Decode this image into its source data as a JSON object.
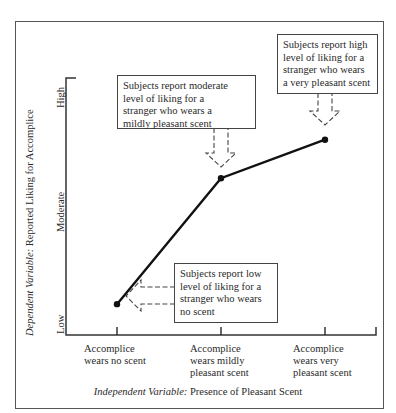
{
  "chart_data": {
    "type": "line",
    "title": "",
    "xlabel": "Independent Variable: Presence of Pleasant Scent",
    "xlabel_italic_prefix": "Independent Variable:",
    "xlabel_rest": " Presence of Pleasant Scent",
    "ylabel": "Dependent Variable: Reported Liking for Accomplice",
    "ylabel_italic_prefix": "Dependent Variable:",
    "ylabel_rest": " Reported Liking for Accomplice",
    "categories": [
      [
        "Accomplice",
        "wears no scent"
      ],
      [
        "Accomplice",
        "wears mildly",
        "pleasant scent"
      ],
      [
        "Accomplice",
        "wears very",
        "pleasant scent"
      ]
    ],
    "y_ticks": [
      "Low",
      "Moderate",
      "High"
    ],
    "ylim": [
      0,
      10
    ],
    "series": [
      {
        "name": "Reported liking",
        "values": [
          1.2,
          6.1,
          7.6
        ]
      }
    ],
    "annotations": [
      {
        "target": 0,
        "lines": [
          "Subjects report low",
          "level of liking for a",
          "stranger who wears",
          "no scent"
        ]
      },
      {
        "target": 1,
        "lines": [
          "Subjects report moderate",
          "level of liking for a",
          "stranger who wears a",
          "mildly pleasant scent"
        ]
      },
      {
        "target": 2,
        "lines": [
          "Subjects report high",
          "level of liking for a",
          "stranger who wears",
          "a very pleasant scent"
        ]
      }
    ],
    "grid": false,
    "legend": "none"
  }
}
